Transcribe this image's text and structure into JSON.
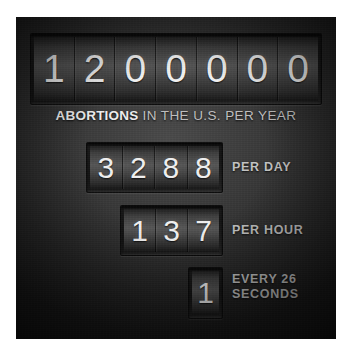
{
  "panel": {
    "background_color": "#2e2e2e",
    "accent_text_color": "#f0f0f0",
    "label_color": "#c4c4c4"
  },
  "chart_data": {
    "type": "table",
    "title": "ABORTIONS IN THE U.S. PER YEAR",
    "xlabel": "",
    "ylabel": "",
    "categories": [
      "Per Year",
      "Per Day",
      "Per Hour",
      "Every 26 Seconds"
    ],
    "values": [
      1200000,
      3288,
      137,
      1
    ],
    "annotations": [
      "1200000 abortions in the U.S. per year",
      "3288 per day",
      "137 per hour",
      "1 every 26 seconds"
    ]
  },
  "headline": {
    "value": "1200000",
    "digits": [
      "1",
      "2",
      "0",
      "0",
      "0",
      "0",
      "0"
    ],
    "subtitle_strong": "ABORTIONS",
    "subtitle_light": " IN THE U.S. PER YEAR"
  },
  "rows": [
    {
      "id": "day",
      "value": "3288",
      "digits": [
        "3",
        "2",
        "8",
        "8"
      ],
      "label": "PER DAY"
    },
    {
      "id": "hour",
      "value": "137",
      "digits": [
        "1",
        "3",
        "7"
      ],
      "label": "PER HOUR"
    },
    {
      "id": "seconds",
      "value": "1",
      "digits": [
        "1"
      ],
      "label_line1": "EVERY 26",
      "label_line2": "SECONDS"
    }
  ]
}
